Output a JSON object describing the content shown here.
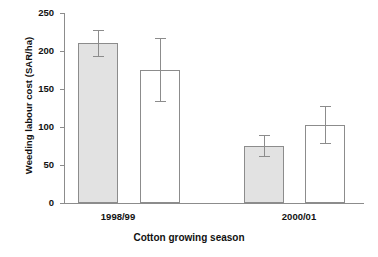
{
  "chart_data": {
    "type": "bar",
    "title": "",
    "xlabel": "Cotton growing season",
    "ylabel": "Weeding labour cost (SAR/ha)",
    "categories": [
      "1998/99",
      "2000/01"
    ],
    "ylim": [
      0,
      250
    ],
    "yticks": [
      0,
      50,
      100,
      150,
      200,
      250
    ],
    "ytick_labels": [
      "0",
      "50",
      "100",
      "150",
      "200",
      "250"
    ],
    "grid": false,
    "legend": null,
    "series": [
      {
        "name": "shaded",
        "style": "filled",
        "fill_color": "#e2e2e2",
        "values": [
          210,
          75
        ],
        "errors": [
          18,
          15
        ]
      },
      {
        "name": "open",
        "style": "hollow",
        "fill_color": "#ffffff",
        "values": [
          175,
          103
        ],
        "errors": [
          42,
          25
        ]
      }
    ],
    "bars": [
      {
        "label": "1998/99 shaded",
        "group": "1998/99",
        "series": "shaded",
        "value": 210,
        "error": 18,
        "style": "filled"
      },
      {
        "label": "1998/99 open",
        "group": "1998/99",
        "series": "open",
        "value": 175,
        "error": 42,
        "style": "hollow"
      },
      {
        "label": "2000/01 shaded",
        "group": "2000/01",
        "series": "shaded",
        "value": 75,
        "error": 15,
        "style": "filled"
      },
      {
        "label": "2000/01 open",
        "group": "2000/01",
        "series": "open",
        "value": 103,
        "error": 25,
        "style": "hollow"
      }
    ]
  }
}
